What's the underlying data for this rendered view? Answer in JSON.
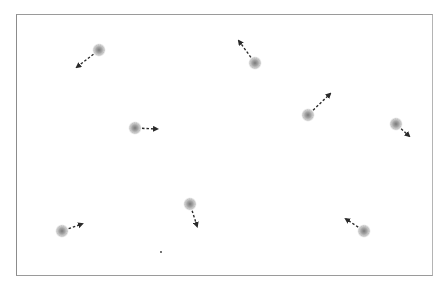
{
  "scene": {
    "type": "particle-simulation",
    "width": 445,
    "height": 288,
    "background": "#ffffff",
    "boundary": {
      "x": 16,
      "y": 14,
      "width": 417,
      "height": 262,
      "color": "#9a9a9a"
    },
    "colors": {
      "particle_outer": "#c8c8c8",
      "particle_inner": "#8a8a8a",
      "arrow": "#2a2a2a"
    },
    "particles": [
      {
        "id": 1,
        "x": 99,
        "y": 50,
        "vx": -22,
        "vy": 17
      },
      {
        "id": 2,
        "x": 255,
        "y": 63,
        "vx": -16,
        "vy": -22
      },
      {
        "id": 3,
        "x": 135,
        "y": 128,
        "vx": 22,
        "vy": 1
      },
      {
        "id": 4,
        "x": 308,
        "y": 115,
        "vx": 22,
        "vy": -21
      },
      {
        "id": 5,
        "x": 396,
        "y": 124,
        "vx": 13,
        "vy": 12
      },
      {
        "id": 6,
        "x": 190,
        "y": 204,
        "vx": 7,
        "vy": 22
      },
      {
        "id": 7,
        "x": 62,
        "y": 231,
        "vx": 20,
        "vy": -7
      },
      {
        "id": 8,
        "x": 364,
        "y": 231,
        "vx": -18,
        "vy": -12
      }
    ],
    "dots": [
      {
        "x": 161,
        "y": 252
      }
    ]
  }
}
